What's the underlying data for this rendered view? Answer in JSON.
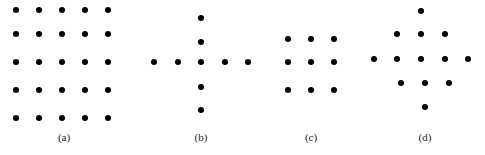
{
  "figure": {
    "dot_color": "#000000",
    "panels": [
      {
        "id": "a",
        "label": "(a)",
        "label_pos": [
          64,
          137
        ],
        "description": "5x5 square grid of dots",
        "dots": [
          [
            16,
            10
          ],
          [
            39,
            10
          ],
          [
            62,
            10
          ],
          [
            85,
            10
          ],
          [
            108,
            10
          ],
          [
            16,
            34
          ],
          [
            39,
            34
          ],
          [
            62,
            34
          ],
          [
            85,
            34
          ],
          [
            108,
            34
          ],
          [
            16,
            62
          ],
          [
            39,
            62
          ],
          [
            62,
            62
          ],
          [
            85,
            62
          ],
          [
            108,
            62
          ],
          [
            16,
            90
          ],
          [
            39,
            90
          ],
          [
            62,
            90
          ],
          [
            85,
            90
          ],
          [
            108,
            90
          ],
          [
            16,
            118
          ],
          [
            39,
            118
          ],
          [
            62,
            118
          ],
          [
            85,
            118
          ],
          [
            108,
            118
          ]
        ]
      },
      {
        "id": "b",
        "label": "(b)",
        "label_pos": [
          201,
          137
        ],
        "description": "Plus / cross pattern of 9 dots",
        "dots": [
          [
            201,
            18
          ],
          [
            201,
            42
          ],
          [
            154,
            62
          ],
          [
            178,
            62
          ],
          [
            201,
            62
          ],
          [
            225,
            62
          ],
          [
            248,
            62
          ],
          [
            201,
            87
          ],
          [
            201,
            110
          ]
        ]
      },
      {
        "id": "c",
        "label": "(c)",
        "label_pos": [
          311,
          137
        ],
        "description": "3x3 square grid of dots",
        "dots": [
          [
            288,
            39
          ],
          [
            311,
            39
          ],
          [
            334,
            39
          ],
          [
            288,
            62
          ],
          [
            311,
            62
          ],
          [
            334,
            62
          ],
          [
            288,
            90
          ],
          [
            311,
            90
          ],
          [
            334,
            90
          ]
        ]
      },
      {
        "id": "d",
        "label": "(d)",
        "label_pos": [
          425,
          137
        ],
        "description": "Diamond pattern of 13 dots",
        "dots": [
          [
            421,
            11
          ],
          [
            397,
            34
          ],
          [
            421,
            34
          ],
          [
            445,
            34
          ],
          [
            374,
            59
          ],
          [
            397,
            59
          ],
          [
            421,
            59
          ],
          [
            445,
            59
          ],
          [
            468,
            59
          ],
          [
            401,
            83
          ],
          [
            425,
            83
          ],
          [
            449,
            83
          ],
          [
            425,
            107
          ]
        ]
      }
    ]
  }
}
